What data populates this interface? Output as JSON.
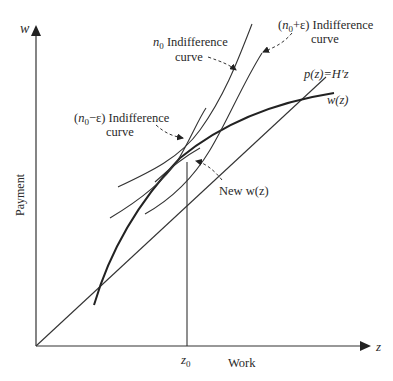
{
  "diagram": {
    "axes": {
      "y_symbol": "w",
      "x_symbol": "z",
      "y_label": "Payment",
      "x_label": "Work",
      "z0_tick": "z",
      "z0_sub": "0"
    },
    "labels": {
      "n0_curve": {
        "var": "n",
        "sub": "0",
        "line1": " Indifference",
        "line2": "curve"
      },
      "n0_plus_curve": {
        "prefix": "(",
        "var": "n",
        "sub": "0",
        "suffix": "+ε) Indifference",
        "line2": "curve"
      },
      "n0_minus_curve": {
        "prefix": "(",
        "var": "n",
        "sub": "0",
        "suffix": "−ε) Indifference",
        "line2": "curve"
      },
      "p_line": "p(z)=H′z",
      "w_curve": "w(z)",
      "new_w": "New w(z)"
    },
    "colors": {
      "line": "#333333",
      "background": "#ffffff"
    }
  }
}
